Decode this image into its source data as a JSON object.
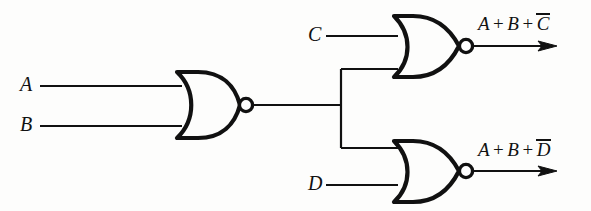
{
  "figure": {
    "stroke_color": "#111111",
    "background_color": "#fdfdfc"
  },
  "inputs": [
    {
      "name": "input-a",
      "label": "A",
      "x": 20,
      "y": 76,
      "wire_y": 86
    },
    {
      "name": "input-b",
      "label": "B",
      "x": 20,
      "y": 116,
      "wire_y": 126
    },
    {
      "name": "input-c",
      "label": "C",
      "x": 308,
      "y": 25,
      "wire_y": 36
    },
    {
      "name": "input-d",
      "label": "D",
      "x": 308,
      "y": 175,
      "wire_y": 185
    }
  ],
  "gates": [
    {
      "name": "nor-gate-ab",
      "type": "NOR",
      "inputs": [
        "A",
        "B"
      ],
      "output": "A + B"
    },
    {
      "name": "nor-gate-c",
      "type": "NOR",
      "inputs": [
        "A + B",
        "C"
      ],
      "output": "A + B + C"
    },
    {
      "name": "nor-gate-d",
      "type": "NOR",
      "inputs": [
        "A + B",
        "D"
      ],
      "output": "A + B + D"
    }
  ],
  "outputs": [
    {
      "name": "output-top",
      "x": 478,
      "y": 14,
      "terms": [
        "A",
        "B",
        "C"
      ],
      "overlined_term": "C",
      "plain": "A + B + C"
    },
    {
      "name": "output-bottom",
      "x": 478,
      "y": 140,
      "terms": [
        "A",
        "B",
        "D"
      ],
      "overlined_term": "D",
      "plain": "A + B + D"
    }
  ],
  "operators": {
    "plus": "+"
  }
}
